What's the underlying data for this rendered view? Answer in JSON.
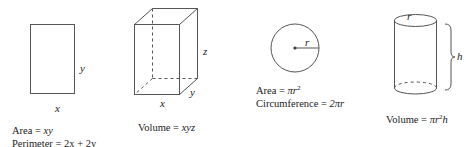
{
  "figures": {
    "rectangle": {
      "labels": {
        "width": "x",
        "height": "y"
      },
      "formulas": {
        "area_prefix": "Area = ",
        "area_expr": "xy",
        "perimeter_prefix": "Perimeter = ",
        "perimeter_expr_a": "2x",
        "perimeter_plus": " + ",
        "perimeter_expr_b": "2y"
      }
    },
    "box": {
      "labels": {
        "width": "x",
        "depth": "y",
        "height": "z"
      },
      "formulas": {
        "volume_prefix": "Volume = ",
        "volume_expr": "xyz"
      }
    },
    "circle": {
      "labels": {
        "radius": "r"
      },
      "formulas": {
        "area_prefix": "Area = ",
        "area_expr": "πr",
        "area_exp": "2",
        "circumference_prefix": "Circumference = ",
        "circumference_expr": "2πr"
      }
    },
    "cylinder": {
      "labels": {
        "radius": "r",
        "height": "h"
      },
      "formulas": {
        "volume_prefix": "Volume = ",
        "volume_expr": "πr",
        "volume_exp": "2",
        "volume_tail": "h"
      }
    }
  },
  "colors": {
    "stroke": "#555555",
    "text": "#222222"
  }
}
